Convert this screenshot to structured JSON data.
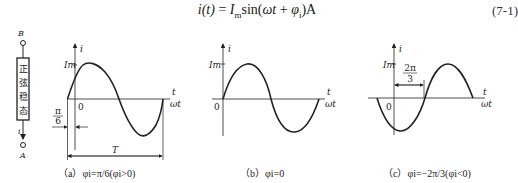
{
  "equation": {
    "text": "i(t) = I_m sin(ωt + φ_i) A",
    "lhs": "i(t)",
    "eq": " = ",
    "amp": "I",
    "amp_sub": "m",
    "fn": "sin(",
    "arg": "ωt",
    "plus": " + ",
    "phase": "φ",
    "phase_sub": "i",
    "close": ")A",
    "number": "(7-1)"
  },
  "circuit": {
    "terminal_top": "B",
    "terminal_bottom": "A",
    "box_label_chars": [
      "正",
      "弦",
      "稳",
      "态"
    ],
    "current_label": "i"
  },
  "plots": [
    {
      "id": "a",
      "y_axis_label": "i",
      "amplitude_label": "Im",
      "x_axis_label_top": "t",
      "x_axis_label_bottom": "ωt",
      "origin_label": "0",
      "phase_annotation": "π/6",
      "phase_num": "π",
      "phase_den": "6",
      "period_label": "T",
      "caption": "（a）φi=π/6(φi>0)",
      "phase_rad": 0.5236
    },
    {
      "id": "b",
      "y_axis_label": "i",
      "amplitude_label": "Im",
      "x_axis_label_top": "t",
      "x_axis_label_bottom": "ωt",
      "origin_label": "0",
      "caption": "（b）φi=0",
      "phase_rad": 0
    },
    {
      "id": "c",
      "y_axis_label": "i",
      "amplitude_label": "Im",
      "x_axis_label_top": "t",
      "x_axis_label_bottom": "ωt",
      "origin_label": "0",
      "phase_annotation": "2π/3",
      "phase_num": "2π",
      "phase_den": "3",
      "caption": "（c）φi=−2π/3(φi<0)",
      "phase_rad": -2.0944
    }
  ]
}
